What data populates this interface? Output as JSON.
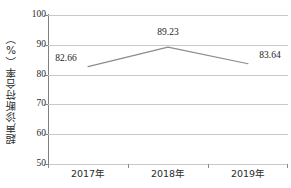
{
  "chart_data": {
    "type": "line",
    "title": "",
    "xlabel": "",
    "ylabel": "超声诊断符合率（%）",
    "categories": [
      "2017年",
      "2018年",
      "2019年"
    ],
    "values": [
      82.66,
      89.23,
      83.64
    ],
    "series": [
      {
        "name": "超声诊断符合率",
        "values": [
          82.66,
          89.23,
          83.64
        ]
      }
    ],
    "data_labels": [
      "82.66",
      "89.23",
      "83.64"
    ],
    "ylim": [
      50,
      100
    ],
    "yticks": [
      50,
      60,
      70,
      80,
      90,
      100
    ],
    "ytick_labels": [
      "50",
      "60",
      "70",
      "80",
      "90",
      "100"
    ],
    "grid": "horizontal",
    "legend": "none",
    "line_color": "#8c8c8c",
    "grid_color": "#c9c9c9",
    "axis_color": "#808080",
    "text_color": "#231f20",
    "background_color": "#ffffff"
  }
}
